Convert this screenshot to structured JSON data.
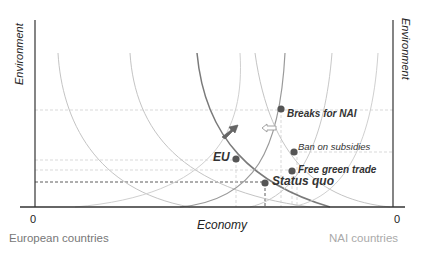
{
  "figure": {
    "type": "diagram",
    "title": "",
    "axes": {
      "x_label": "Economy",
      "y_label_left": "Environment",
      "y_label_right": "Environment",
      "origin_left_label": "0",
      "origin_right_label": "0",
      "origin_left_caption": "European countries",
      "origin_right_caption": "NAI countries"
    },
    "points": [
      {
        "id": "breaks-for-nai",
        "label": "Breaks for NAI",
        "x": 281,
        "y": 109
      },
      {
        "id": "eu",
        "label": "EU",
        "x": 236,
        "y": 159
      },
      {
        "id": "ban-on-subsidies",
        "label": "Ban on subsidies",
        "x": 294,
        "y": 152
      },
      {
        "id": "free-green-trade",
        "label": "Free green trade",
        "x": 292,
        "y": 171
      },
      {
        "id": "status-quo",
        "label": "Status quo",
        "x": 265,
        "y": 183
      }
    ],
    "arrows": [
      {
        "id": "eu-shift-arrow",
        "style": "filled",
        "direction": "up-right"
      },
      {
        "id": "nai-shift-arrow",
        "style": "hollow",
        "direction": "left"
      }
    ],
    "curve_families": [
      {
        "name": "European indifference curves",
        "count": 3
      },
      {
        "name": "NAI indifference curves",
        "count": 4
      }
    ],
    "colors": {
      "axis": "#333333",
      "highlight_curve": "#777777",
      "light_curve": "#bdbdbd",
      "dot": "#555555",
      "caption_left": "#777777",
      "caption_right": "#aaaaaa"
    }
  }
}
